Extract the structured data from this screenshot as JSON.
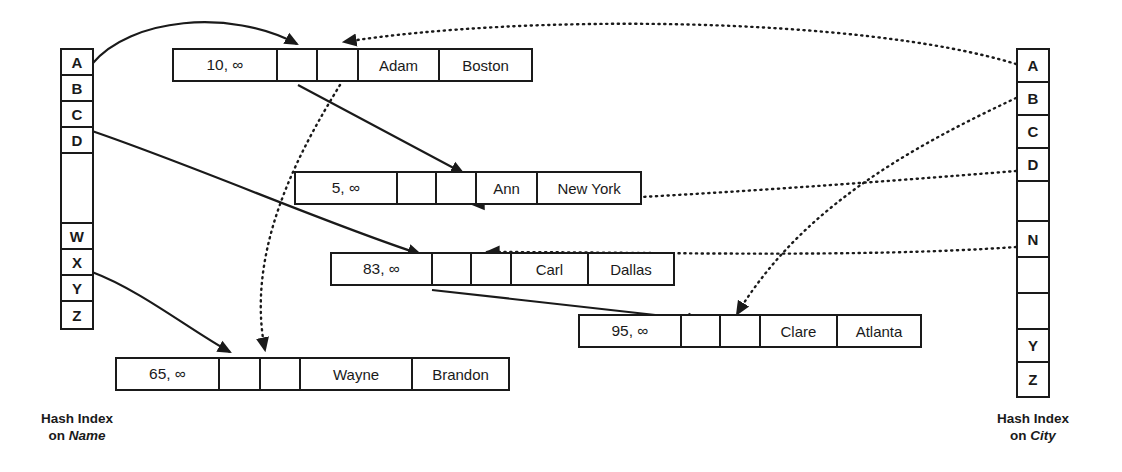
{
  "diagram": {
    "ink_color": "#1a1a1a",
    "background": "#ffffff"
  },
  "left_index": {
    "caption_line1": "Hash Index",
    "caption_line2_prefix": "on ",
    "caption_field": "Name",
    "cells": [
      {
        "label": "A",
        "height": 26
      },
      {
        "label": "B",
        "height": 26
      },
      {
        "label": "C",
        "height": 26
      },
      {
        "label": "D",
        "height": 26
      },
      {
        "label": "",
        "height": 70
      },
      {
        "label": "W",
        "height": 26
      },
      {
        "label": "X",
        "height": 26
      },
      {
        "label": "Y",
        "height": 26
      },
      {
        "label": "Z",
        "height": 26
      }
    ]
  },
  "right_index": {
    "caption_line1": "Hash Index",
    "caption_line2_prefix": "on ",
    "caption_field": "City",
    "cells": [
      {
        "label": "A",
        "height": 33
      },
      {
        "label": "B",
        "height": 33
      },
      {
        "label": "C",
        "height": 33
      },
      {
        "label": "D",
        "height": 33
      },
      {
        "label": "",
        "height": 40
      },
      {
        "label": "N",
        "height": 36
      },
      {
        "label": "",
        "height": 36
      },
      {
        "label": "",
        "height": 36
      },
      {
        "label": "Y",
        "height": 33
      },
      {
        "label": "Z",
        "height": 33
      }
    ]
  },
  "records": [
    {
      "id": "record-adam",
      "timestamp": "10, ∞",
      "pointer1": "",
      "pointer2": "",
      "name": "Adam",
      "city": "Boston"
    },
    {
      "id": "record-ann",
      "timestamp": "5, ∞",
      "pointer1": "",
      "pointer2": "",
      "name": "Ann",
      "city": "New York"
    },
    {
      "id": "record-carl",
      "timestamp": "83, ∞",
      "pointer1": "",
      "pointer2": "",
      "name": "Carl",
      "city": "Dallas"
    },
    {
      "id": "record-clare",
      "timestamp": "95, ∞",
      "pointer1": "",
      "pointer2": "",
      "name": "Clare",
      "city": "Atlanta"
    },
    {
      "id": "record-wayne",
      "timestamp": "65, ∞",
      "pointer1": "",
      "pointer2": "",
      "name": "Wayne",
      "city": "Brandon"
    }
  ],
  "edges": {
    "solid_description": "Hash index on Name links: A -> Adam, C -> Carl, W -> Wayne; record chain Adam -> Ann, Carl -> Clare",
    "dotted_description": "Hash index on City links: A -> Adam(Boston), D -> Ann(New York), N -> Carl(Dallas), B -> Clare(Atlanta); record chain Adam -> Wayne"
  }
}
